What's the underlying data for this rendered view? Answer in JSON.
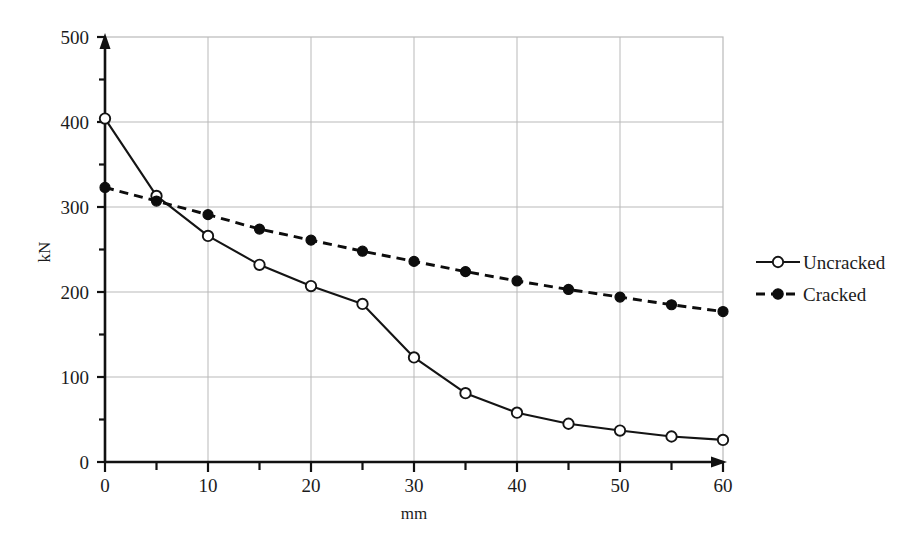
{
  "chart_data": {
    "type": "line",
    "title": "",
    "xlabel": "mm",
    "ylabel": "kN",
    "xlim": [
      0,
      60
    ],
    "ylim": [
      0,
      500
    ],
    "grid": true,
    "x_ticks": [
      0,
      10,
      20,
      30,
      40,
      50,
      60
    ],
    "x_tick_labels": [
      "0",
      "10",
      "20",
      "30",
      "40",
      "50",
      "60"
    ],
    "x_minor_ticks": [
      5,
      15,
      25,
      35,
      45,
      55
    ],
    "y_ticks": [
      0,
      100,
      200,
      300,
      400,
      500
    ],
    "y_tick_labels": [
      "0",
      "100",
      "200",
      "300",
      "400",
      "500"
    ],
    "y_minor_ticks": [
      50,
      150,
      250,
      350,
      450
    ],
    "x": [
      0,
      5,
      10,
      15,
      20,
      25,
      30,
      35,
      40,
      45,
      50,
      55,
      60
    ],
    "legend_position": "right",
    "series": [
      {
        "name": "Uncracked",
        "marker": "open-circle",
        "line_style": "solid",
        "color": "#141414",
        "values": [
          404,
          313,
          266,
          232,
          207,
          186,
          123,
          81,
          58,
          45,
          37,
          30,
          26
        ]
      },
      {
        "name": "Cracked",
        "marker": "filled-circle",
        "line_style": "dashed",
        "color": "#0d0d0d",
        "values": [
          323,
          307,
          291,
          274,
          261,
          248,
          236,
          224,
          213,
          203,
          194,
          185,
          177
        ]
      }
    ]
  },
  "axes": {
    "x_axis_title": "mm",
    "y_axis_title": "kN"
  },
  "legend": {
    "items": [
      {
        "label": "Uncracked",
        "style": "solid-open-circle"
      },
      {
        "label": "Cracked",
        "style": "dashed-filled-circle"
      }
    ]
  },
  "y_labels": {
    "t0": "0",
    "t1": "100",
    "t2": "200",
    "t3": "300",
    "t4": "400",
    "t5": "500"
  },
  "x_labels": {
    "t0": "0",
    "t1": "10",
    "t2": "20",
    "t3": "30",
    "t4": "40",
    "t5": "50",
    "t6": "60"
  }
}
